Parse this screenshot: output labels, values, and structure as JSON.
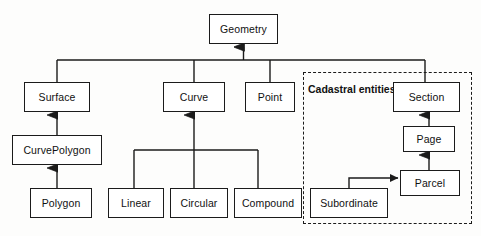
{
  "diagram": {
    "type": "uml-class-hierarchy",
    "style": {
      "background": "#fdfdfc",
      "node_fill": "#ffffff",
      "stroke": "#1b1b1b",
      "text": "#111111"
    },
    "group": {
      "label": "Cadastral entities",
      "border_style": "dashed",
      "x": 303,
      "y": 72,
      "width": 169,
      "height": 152,
      "label_x": 308,
      "label_y": 84
    },
    "nodes": [
      {
        "id": "geometry",
        "label": "Geometry",
        "x": 209,
        "y": 14,
        "width": 69,
        "height": 30
      },
      {
        "id": "surface",
        "label": "Surface",
        "x": 24,
        "y": 82,
        "width": 66,
        "height": 30
      },
      {
        "id": "curve",
        "label": "Curve",
        "x": 163,
        "y": 82,
        "width": 62,
        "height": 30
      },
      {
        "id": "point",
        "label": "Point",
        "x": 245,
        "y": 82,
        "width": 50,
        "height": 30
      },
      {
        "id": "section",
        "label": "Section",
        "x": 393,
        "y": 82,
        "width": 67,
        "height": 30
      },
      {
        "id": "curvepolygon",
        "label": "CurvePolygon",
        "x": 12,
        "y": 135,
        "width": 90,
        "height": 30
      },
      {
        "id": "page",
        "label": "Page",
        "x": 403,
        "y": 126,
        "width": 52,
        "height": 26
      },
      {
        "id": "parcel",
        "label": "Parcel",
        "x": 400,
        "y": 170,
        "width": 60,
        "height": 26
      },
      {
        "id": "polygon",
        "label": "Polygon",
        "x": 30,
        "y": 188,
        "width": 62,
        "height": 30
      },
      {
        "id": "linear",
        "label": "Linear",
        "x": 108,
        "y": 188,
        "width": 56,
        "height": 30
      },
      {
        "id": "circular",
        "label": "Circular",
        "x": 170,
        "y": 188,
        "width": 58,
        "height": 30
      },
      {
        "id": "compound",
        "label": "Compound",
        "x": 234,
        "y": 188,
        "width": 68,
        "height": 30
      },
      {
        "id": "subordinate",
        "label": "Subordinate",
        "x": 310,
        "y": 188,
        "width": 78,
        "height": 30
      }
    ],
    "edges": [
      {
        "id": "bus-to-geometry",
        "from": "bus-main",
        "to": "geometry",
        "kind": "generalization",
        "arrow": "triangle-up"
      },
      {
        "id": "surface-bus",
        "from": "surface",
        "to": "bus-main",
        "kind": "generalization",
        "arrow": "none"
      },
      {
        "id": "curve-bus",
        "from": "curve",
        "to": "bus-main",
        "kind": "generalization",
        "arrow": "none"
      },
      {
        "id": "point-bus",
        "from": "point",
        "to": "bus-main",
        "kind": "generalization",
        "arrow": "none"
      },
      {
        "id": "section-bus",
        "from": "section",
        "to": "bus-main",
        "kind": "generalization",
        "arrow": "none"
      },
      {
        "id": "cp-surface",
        "from": "curvepolygon",
        "to": "surface",
        "kind": "generalization",
        "arrow": "triangle-up"
      },
      {
        "id": "polygon-cp",
        "from": "polygon",
        "to": "curvepolygon",
        "kind": "generalization",
        "arrow": "triangle-up"
      },
      {
        "id": "subbus-curve",
        "from": "bus-curve",
        "to": "curve",
        "kind": "generalization",
        "arrow": "triangle-up"
      },
      {
        "id": "linear-subbus",
        "from": "linear",
        "to": "bus-curve",
        "kind": "generalization",
        "arrow": "none"
      },
      {
        "id": "circular-subbus",
        "from": "circular",
        "to": "bus-curve",
        "kind": "generalization",
        "arrow": "none"
      },
      {
        "id": "compound-subbus",
        "from": "compound",
        "to": "bus-curve",
        "kind": "generalization",
        "arrow": "none"
      },
      {
        "id": "page-section",
        "from": "page",
        "to": "section",
        "kind": "generalization",
        "arrow": "triangle-up"
      },
      {
        "id": "parcel-page",
        "from": "parcel",
        "to": "page",
        "kind": "generalization",
        "arrow": "triangle-up"
      },
      {
        "id": "sub-parcel",
        "from": "subordinate",
        "to": "parcel",
        "kind": "association",
        "arrow": "solid-right"
      }
    ]
  }
}
